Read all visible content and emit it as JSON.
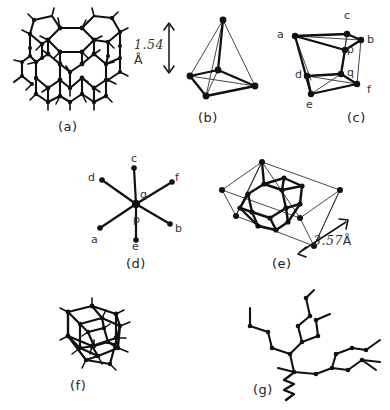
{
  "figure": {
    "background": "#ffffff",
    "ink_color": "#111111"
  },
  "panels": [
    {
      "id": "a",
      "caption": "(a)",
      "name": "diamond-lattice-panel",
      "description": "Extended diamond crystal lattice of tetrahedrally bonded carbon atoms",
      "structure": "lattice"
    },
    {
      "id": "b",
      "caption": "(b)",
      "name": "tetrahedron-panel",
      "description": "Single carbon tetrahedron with central atom",
      "structure": "tetrahedron",
      "measurement": {
        "value": "1.54",
        "unit": "Å",
        "label": "1.54 Å"
      }
    },
    {
      "id": "c",
      "caption": "(c)",
      "name": "double-tetrahedron-panel",
      "description": "Two staggered tetrahedra joined by a p-q bond",
      "structure": "double-tetrahedron",
      "vertex_labels": [
        "a",
        "b",
        "c",
        "d",
        "e",
        "f"
      ],
      "center_labels": [
        "p",
        "q"
      ]
    },
    {
      "id": "d",
      "caption": "(d)",
      "name": "newman-projection-panel",
      "description": "Newman projection looking down the p-q bond, staggered conformation",
      "structure": "newman",
      "vertex_labels": [
        "a",
        "b",
        "c",
        "d",
        "e",
        "f"
      ],
      "center_labels": [
        "p",
        "q"
      ]
    },
    {
      "id": "e",
      "caption": "(e)",
      "name": "unit-cell-panel",
      "description": "Diamond cubic unit cell outline enclosing an adamantane cage",
      "structure": "unit-cell",
      "measurement": {
        "value": "3.57",
        "unit": "Å",
        "label": "3.57 Å"
      }
    },
    {
      "id": "f",
      "caption": "(f)",
      "name": "adamantane-cage-panel",
      "description": "Adamantane-like carbon cage with hydrogen stubs",
      "structure": "cage"
    },
    {
      "id": "g",
      "caption": "(g)",
      "name": "branched-chain-panel",
      "description": "Branched alkane zigzag chains with a squiggle bond",
      "structure": "branched-chain"
    }
  ],
  "labels": {
    "a": "a",
    "b": "b",
    "c": "c",
    "d": "d",
    "e": "e",
    "f": "f",
    "p": "p",
    "q": "q"
  },
  "measurements": {
    "bond_length": "1.54",
    "bond_length_unit": "Å",
    "cell_edge": "3.57",
    "cell_edge_unit": "Å"
  }
}
